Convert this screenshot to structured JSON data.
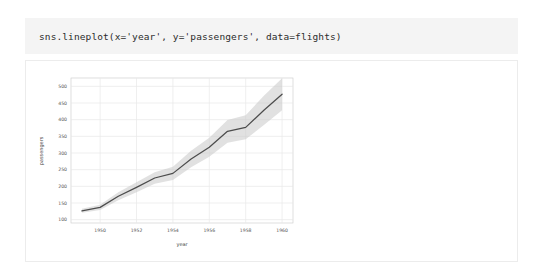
{
  "cell": {
    "code": "sns.lineplot(x='year', y='passengers', data=flights)"
  },
  "colors": {
    "code_cell_background": "#f4f4f4",
    "output_background": "#ffffff",
    "line": "#4c4c4c",
    "confidence_band": "#c9c9c9",
    "gridline": "#e8e8e8",
    "axes_border": "#d0d0d0",
    "tick_text": "#555555"
  },
  "chart_data": {
    "type": "line",
    "title": "",
    "xlabel": "year",
    "ylabel": "passengers",
    "grid": true,
    "legend": "none",
    "xlim": [
      1948.4,
      1960.6
    ],
    "ylim": [
      90,
      525
    ],
    "xticks": [
      1950,
      1952,
      1954,
      1956,
      1958,
      1960
    ],
    "xtick_labels": [
      "1950",
      "1952",
      "1954",
      "1956",
      "1958",
      "1960"
    ],
    "yticks": [
      100,
      150,
      200,
      250,
      300,
      350,
      400,
      450,
      500
    ],
    "ytick_labels": [
      "100",
      "150",
      "200",
      "250",
      "300",
      "350",
      "400",
      "450",
      "500"
    ],
    "x": [
      1949,
      1950,
      1951,
      1952,
      1953,
      1954,
      1955,
      1956,
      1957,
      1958,
      1959,
      1960
    ],
    "series": [
      {
        "name": "passengers",
        "values": [
          126.7,
          136.9,
          170.2,
          197.0,
          225.0,
          238.9,
          281.8,
          317.5,
          365.0,
          377.0,
          428.3,
          476.2
        ]
      }
    ],
    "confidence_interval": {
      "level": 95,
      "lower": [
        121.0,
        129.0,
        158.0,
        182.0,
        208.0,
        219.0,
        257.0,
        289.0,
        331.0,
        341.0,
        384.0,
        428.0
      ],
      "upper": [
        133.0,
        145.0,
        182.0,
        212.0,
        242.0,
        259.0,
        307.0,
        346.0,
        399.0,
        413.0,
        472.0,
        524.0
      ]
    }
  }
}
